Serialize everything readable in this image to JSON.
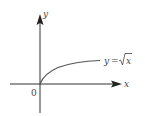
{
  "figure": {
    "axes": {
      "x_label": "x",
      "y_label": "y",
      "origin_label": "0"
    },
    "curve": {
      "equation_lhs": "y",
      "equation_eq": "=",
      "equation_radicand": "x",
      "function": "sqrt"
    },
    "colors": {
      "axis": "#333333",
      "curve": "#555555",
      "text": "#444444"
    }
  }
}
